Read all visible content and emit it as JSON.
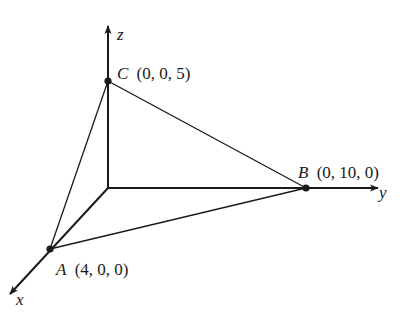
{
  "axes": {
    "x": {
      "label": "x"
    },
    "y": {
      "label": "y"
    },
    "z": {
      "label": "z"
    }
  },
  "points": {
    "A": {
      "name": "A",
      "coords": "(4, 0, 0)"
    },
    "B": {
      "name": "B",
      "coords": "(0, 10, 0)"
    },
    "C": {
      "name": "C",
      "coords": "(0, 0, 5)"
    }
  },
  "colors": {
    "ink": "#1a1a1a",
    "background": "#ffffff"
  }
}
